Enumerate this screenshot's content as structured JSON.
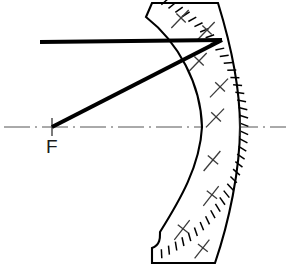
{
  "figure": {
    "kind": "optics-ray-diagram",
    "width": 288,
    "height": 279,
    "background_color": "#ffffff",
    "ink_color": "#000000"
  },
  "labels": {
    "focus": "F"
  },
  "optical_axis": {
    "name": "optical-axis",
    "style": "dash-dot centerline",
    "color": "#555555",
    "y": 127,
    "x_start": 4,
    "x_end": 286
  },
  "focal_point": {
    "name": "focal-point",
    "x": 52,
    "y": 127,
    "tick_half_height": 9,
    "label": "F",
    "label_x": 46,
    "label_y": 153
  },
  "vertex": {
    "name": "mirror-vertex",
    "x": 240,
    "y": 127
  },
  "incident_ray": {
    "name": "incident-ray",
    "color": "#000000",
    "width": 4.1,
    "x1": 40,
    "y1": 42,
    "x2": 222,
    "y2": 40
  },
  "reflected_ray": {
    "name": "reflected-ray",
    "color": "#000000",
    "width": 4.1,
    "x1": 222,
    "y1": 40,
    "x2": 52,
    "y2": 127
  },
  "mirror": {
    "name": "concave-mirror-body",
    "fill": "#ffffff",
    "stroke": "#000000",
    "stroke_width": 2.1,
    "outline_path": "M 152 3 L 218 3 C 231 45 240 86 240 127 C 240 170 229 222 215 263 L 152 263 L 152 248 C 161 245 160 236 160 232 C 180 200 200 166 202 127 C 201 84 178 42 146 17 Z",
    "front_surface": {
      "name": "concave-front-surface",
      "description": "concave reflecting face, crosses axis at x=202",
      "axis_crossing_x": 202
    },
    "back_surface": {
      "name": "convex-back-surface",
      "description": "convex rear face carrying radial reflective hatch ticks, crosses axis at x=240",
      "axis_crossing_x": 240
    }
  },
  "mirror_ticks": {
    "name": "mirror-reflective-ticks",
    "count": 40,
    "length": 9,
    "color": "#000000",
    "width": 1.5,
    "arc": {
      "cx": 100,
      "cy": 127,
      "rx": 140,
      "ry": 136,
      "start_deg": -64,
      "end_deg": 64
    }
  },
  "section_hatches": {
    "name": "section-hatch-marks",
    "symbol": "slanted line with perpendicular cross-stroke",
    "color": "#3a3a3a",
    "marks": [
      {
        "x": 180,
        "y": 19,
        "length": 25,
        "angle": -46
      },
      {
        "x": 206,
        "y": 31,
        "length": 25,
        "angle": -46
      },
      {
        "x": 198,
        "y": 62,
        "length": 25,
        "angle": -46
      },
      {
        "x": 219,
        "y": 88,
        "length": 26,
        "angle": -46
      },
      {
        "x": 215,
        "y": 118,
        "length": 26,
        "angle": -46
      },
      {
        "x": 212,
        "y": 161,
        "length": 26,
        "angle": -50
      },
      {
        "x": 211,
        "y": 196,
        "length": 25,
        "angle": -52
      },
      {
        "x": 182,
        "y": 230,
        "length": 25,
        "angle": -52
      },
      {
        "x": 202,
        "y": 249,
        "length": 24,
        "angle": -52
      }
    ]
  }
}
